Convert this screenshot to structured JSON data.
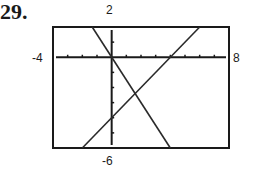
{
  "problem": {
    "number": "29."
  },
  "window": {
    "xmin": "-4",
    "xmax": "8",
    "ymin": "-6",
    "ymax": "2"
  },
  "chart_data": {
    "type": "line",
    "title": "",
    "xlabel": "",
    "ylabel": "",
    "xlim": [
      -4,
      8
    ],
    "ylim": [
      -6,
      2
    ],
    "xscale": 1,
    "yscale": 1,
    "grid": false,
    "tick_labels": {
      "xmin": "-4",
      "xmax": "8",
      "ymin": "-6",
      "ymax": "2"
    },
    "series": [
      {
        "name": "line-descending",
        "equation": "y = -1.5x",
        "x": [
          -1.33,
          4
        ],
        "y": [
          2,
          -6
        ]
      },
      {
        "name": "line-ascending",
        "equation": "y = x - 4",
        "x": [
          -2,
          6
        ],
        "y": [
          -6,
          2
        ]
      }
    ],
    "annotations": [
      {
        "type": "intersection",
        "x": 1.6,
        "y": -2.4
      }
    ]
  }
}
